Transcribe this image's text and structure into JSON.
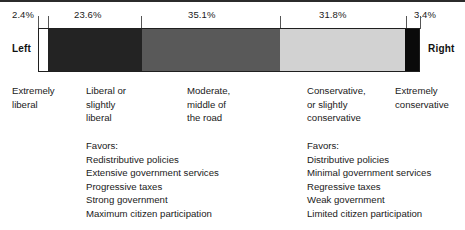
{
  "chart_data": {
    "type": "bar",
    "title": "",
    "subtitle": "",
    "orientation": "horizontal-stacked",
    "xlabel": "",
    "ylabel": "",
    "legend_position": "none",
    "grid": false,
    "axis_left_label": "Left",
    "axis_right_label": "Right",
    "categories": [
      "Extremely liberal",
      "Liberal or slightly liberal",
      "Moderate, middle of the road",
      "Conservative, or slightly conservative",
      "Extremely conservative"
    ],
    "values": [
      2.4,
      23.6,
      35.1,
      31.8,
      3.4
    ],
    "value_labels": [
      "2.4%",
      "23.6%",
      "35.1%",
      "31.8%",
      "3.4%"
    ],
    "segment_colors": [
      "#ffffff",
      "#232323",
      "#595959",
      "#d2d2d2",
      "#0a0a0a"
    ],
    "total": 96.3,
    "units": "percent"
  },
  "axis": {
    "left_label": "Left",
    "right_label": "Right"
  },
  "percentages": [
    {
      "text": "2.4%",
      "left": 12
    },
    {
      "text": "23.6%",
      "left": 74
    },
    {
      "text": "35.1%",
      "left": 188
    },
    {
      "text": "31.8%",
      "left": 319
    },
    {
      "text": "3.4%",
      "left": 414
    }
  ],
  "segments": [
    {
      "name": "extremely-liberal",
      "pct": 2.4,
      "color": "#ffffff",
      "width_px": 9.5
    },
    {
      "name": "liberal-slightly-liberal",
      "pct": 23.6,
      "color": "#232323",
      "width_px": 93.6
    },
    {
      "name": "moderate",
      "pct": 35.1,
      "color": "#595959",
      "width_px": 139.2
    },
    {
      "name": "conservative-slightly",
      "pct": 31.8,
      "color": "#d2d2d2",
      "width_px": 126.1
    },
    {
      "name": "extremely-conservative",
      "pct": 3.4,
      "color": "#0a0a0a",
      "width_px": 13.6
    }
  ],
  "ticks": [
    38,
    47.5,
    141.1,
    280.3,
    406.4,
    420
  ],
  "categories": [
    {
      "name": "extremely-liberal",
      "lines": [
        "Extremely",
        "liberal"
      ],
      "left": 12
    },
    {
      "name": "liberal-slightly-liberal",
      "lines": [
        "Liberal or",
        "slightly",
        "liberal"
      ],
      "left": 86
    },
    {
      "name": "moderate",
      "lines": [
        "Moderate,",
        "middle of",
        "the road"
      ],
      "left": 187
    },
    {
      "name": "conservative-slightly",
      "lines": [
        "Conservative,",
        "or slightly",
        "conservative"
      ],
      "left": 307
    },
    {
      "name": "extremely-conservative",
      "lines": [
        "Extremely",
        "conservative"
      ],
      "left": 395
    }
  ],
  "favors_left": {
    "title": "Favors:",
    "left": 86,
    "items": [
      "Redistributive policies",
      "Extensive government services",
      "Progressive taxes",
      "Strong government",
      "Maximum citizen participation"
    ]
  },
  "favors_right": {
    "title": "Favors:",
    "left": 307,
    "items": [
      "Distributive policies",
      "Minimal government services",
      "Regressive taxes",
      "Weak government",
      "Limited citizen participation"
    ]
  }
}
